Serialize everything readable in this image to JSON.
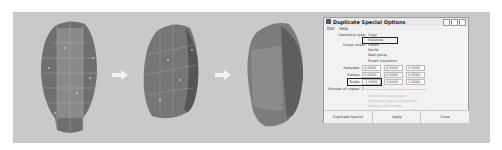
{
  "figure": {
    "heads": [
      {
        "label": "Original low-poly head mesh with vertices"
      },
      {
        "label": "Half head mirrored"
      },
      {
        "label": "Smoothed head result"
      }
    ],
    "arrows": [
      "arrow-right",
      "arrow-right"
    ]
  },
  "dialog": {
    "title": "Duplicate Special Options",
    "menu": [
      "Edit",
      "Help"
    ],
    "geometry_type_label": "Geometry type:",
    "geometry_type_options": [
      "Copy",
      "Instance"
    ],
    "group_under_label": "Group under:",
    "group_under_options": [
      "Parent",
      "World",
      "New group"
    ],
    "smart_transform_label": "Smart transform",
    "translate_label": "Translate:",
    "translate": [
      "0.0000",
      "0.0000",
      "0.0000"
    ],
    "rotate_label": "Rotate:",
    "rotate": [
      "0.0000",
      "0.0000",
      "0.0000"
    ],
    "scale_label": "Scale:",
    "scale": [
      "-1.0000",
      "1.0000",
      "1.0000"
    ],
    "number_of_copies_label": "Number of copies:",
    "number_of_copies": "1",
    "disabled_options": [
      "Duplicate input graph",
      "Duplicate input connections",
      "Instance leaf nodes"
    ],
    "assign_unique_label": "Assign unique name to child nodes",
    "buttons": {
      "duplicate": "Duplicate Special",
      "apply": "Apply",
      "close": "Close"
    }
  }
}
